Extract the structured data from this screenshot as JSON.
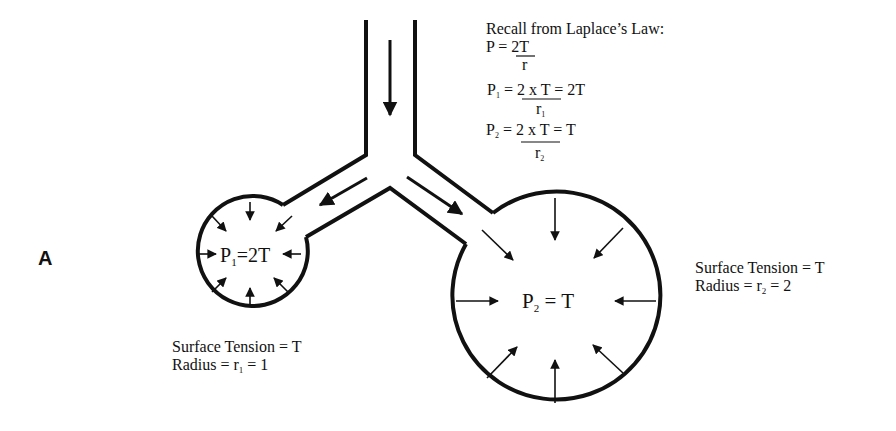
{
  "panel_label": "A",
  "laplace": {
    "title": "Recall from Laplace’s Law:",
    "eq1_lhs": "P = ",
    "eq1_num": "2T",
    "eq1_den": "r",
    "eq2_lhs": "P",
    "eq2_lhs_sub": "1",
    "eq2_eq": " = ",
    "eq2_num": "2 x T",
    "eq2_rhs": " = 2T",
    "eq2_den": "r",
    "eq2_den_sub": "1",
    "eq3_lhs": "P",
    "eq3_lhs_sub": "2",
    "eq3_eq": " = ",
    "eq3_num": "2 x T",
    "eq3_rhs": " = T",
    "eq3_den": "r",
    "eq3_den_sub": "2"
  },
  "small_alveolus": {
    "pressure_p": "P",
    "pressure_sub": "1",
    "pressure_rhs": "=2T",
    "tension_label": "Surface Tension = T",
    "radius_label": "Radius = r",
    "radius_sub": "1",
    "radius_rhs": " = 1"
  },
  "large_alveolus": {
    "pressure_p": "P",
    "pressure_sub": "2",
    "pressure_rhs": " = T",
    "tension_label": "Surface Tension = T",
    "radius_label": "Radius = r",
    "radius_sub": "2",
    "radius_rhs": " = 2"
  }
}
